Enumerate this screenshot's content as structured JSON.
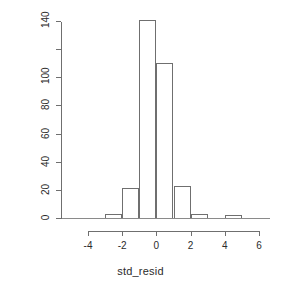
{
  "chart_data": {
    "type": "bar",
    "subtype": "histogram",
    "title": "",
    "xlabel": "std_resid",
    "ylabel": "Frequency",
    "grid": false,
    "legend": false,
    "legend_position": "none",
    "xlim": [
      -4,
      6
    ],
    "ylim": [
      0,
      141
    ],
    "bin_width": 1,
    "bin_edges": [
      -4,
      -3,
      -2,
      -1,
      0,
      1,
      2,
      3,
      4,
      5,
      6
    ],
    "categories": [
      "-4 to -3",
      "-3 to -2",
      "-2 to -1",
      "-1 to 0",
      "0 to 1",
      "1 to 2",
      "2 to 3",
      "3 to 4",
      "4 to 5",
      "5 to 6"
    ],
    "bin_centers": [
      -3.5,
      -2.5,
      -1.5,
      -0.5,
      0.5,
      1.5,
      2.5,
      3.5,
      4.5,
      5.5
    ],
    "values": [
      0,
      3,
      21,
      141,
      110,
      23,
      3,
      0,
      2,
      0
    ],
    "xticks": [
      -4,
      -2,
      0,
      2,
      4,
      6
    ],
    "xtick_labels": [
      "-4",
      "-2",
      "0",
      "2",
      "4",
      "6"
    ],
    "yticks": [
      0,
      20,
      40,
      60,
      80,
      100,
      120,
      140
    ],
    "ytick_labels": [
      "0",
      "20",
      "40",
      "60",
      "80",
      "100",
      "",
      "140"
    ],
    "bar_fill_color": "#ffffff",
    "bar_border_color": "#6f6f6f",
    "axis_color": "#6f6f6f",
    "text_color": "#2b2b2b",
    "background_color": "#ffffff"
  }
}
